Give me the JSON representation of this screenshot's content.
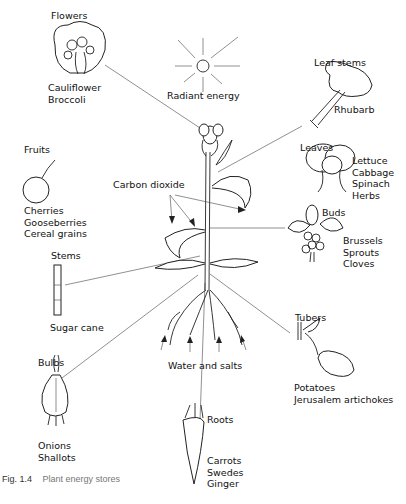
{
  "figure": {
    "caption_number": "Fig. 1.4",
    "caption_text": "Plant energy stores",
    "center_labels": {
      "radiant_energy": "Radiant energy",
      "carbon_dioxide": "Carbon dioxide",
      "water_and_salts": "Water and salts"
    },
    "stores": [
      {
        "id": "flowers",
        "title": "Flowers",
        "examples": [
          "Cauliflower",
          "Broccoli"
        ]
      },
      {
        "id": "leaf-stems",
        "title": "Leaf stems",
        "examples": [
          "Rhubarb"
        ]
      },
      {
        "id": "leaves",
        "title": "Leaves",
        "examples": [
          "Lettuce",
          "Cabbage",
          "Spinach",
          "Herbs"
        ]
      },
      {
        "id": "fruits",
        "title": "Fruits",
        "examples": [
          "Cherries",
          "Gooseberries",
          "Cereal grains"
        ]
      },
      {
        "id": "buds",
        "title": "Buds",
        "examples": [
          "Brussels",
          "Sprouts",
          "Cloves"
        ]
      },
      {
        "id": "stems",
        "title": "Stems",
        "examples": [
          "Sugar cane"
        ]
      },
      {
        "id": "tubers",
        "title": "Tubers",
        "examples": [
          "Potatoes",
          "Jerusalem artichokes"
        ]
      },
      {
        "id": "bulbs",
        "title": "Bulbs",
        "examples": [
          "Onions",
          "Shallots"
        ]
      },
      {
        "id": "roots",
        "title": "Roots",
        "examples": [
          "Carrots",
          "Swedes",
          "Ginger"
        ]
      }
    ]
  }
}
